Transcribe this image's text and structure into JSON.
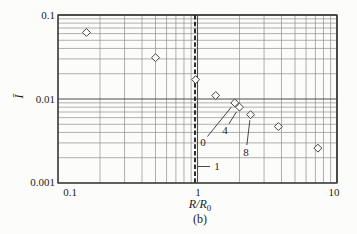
{
  "figure": {
    "caption": "(b)",
    "ylabel": "Ī",
    "xlabel_main": "R/R",
    "xlabel_sub": "0"
  },
  "axis": {
    "x_ticks": [
      "0.1",
      "1",
      "10"
    ],
    "y_ticks": [
      "0.1",
      "0.01",
      "0.001"
    ]
  },
  "chart_data": {
    "type": "scatter",
    "title": "",
    "xlabel": "R/R₀",
    "ylabel": "Ī",
    "xscale": "log",
    "yscale": "log",
    "xlim": [
      0.1,
      10
    ],
    "ylim": [
      0.001,
      0.1
    ],
    "grid": "log grid, major and minor lines on both axes",
    "legend": "none",
    "marker": "open-diamond",
    "points": [
      {
        "x": 0.16,
        "y": 0.062
      },
      {
        "x": 0.5,
        "y": 0.031
      },
      {
        "x": 0.97,
        "y": 0.017
      },
      {
        "x": 1.35,
        "y": 0.011
      },
      {
        "x": 1.85,
        "y": 0.009
      },
      {
        "x": 2.0,
        "y": 0.008
      },
      {
        "x": 2.4,
        "y": 0.0065
      },
      {
        "x": 3.8,
        "y": 0.0047
      },
      {
        "x": 7.3,
        "y": 0.0026
      }
    ],
    "reference_line": {
      "x": 1,
      "style": "bold-dashed-vertical",
      "label": "1"
    },
    "annotations": [
      {
        "label": "0",
        "point_index": 4
      },
      {
        "label": "4",
        "point_index": 5
      },
      {
        "label": "8",
        "point_index": 6
      }
    ]
  }
}
